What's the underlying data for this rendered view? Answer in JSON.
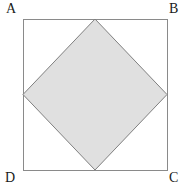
{
  "figure": {
    "background_color": "#ffffff",
    "width": 189,
    "height": 192,
    "outer_square": {
      "name": "ABCD",
      "stroke_color": "#8a8a8a",
      "fill_color": "none",
      "stroke_width": 1,
      "left": 23,
      "top": 19,
      "right": 167,
      "bottom": 170,
      "corners": [
        {
          "label": "A",
          "x": 23,
          "y": 19
        },
        {
          "label": "B",
          "x": 167,
          "y": 19
        },
        {
          "label": "C",
          "x": 167,
          "y": 170
        },
        {
          "label": "D",
          "x": 23,
          "y": 170
        }
      ]
    },
    "inscribed_square": {
      "name": "diamond",
      "stroke_color": "#808080",
      "fill_color": "#e0e0e0",
      "stroke_width": 1,
      "vertices": [
        {
          "position": "top",
          "x": 95,
          "y": 19
        },
        {
          "position": "right",
          "x": 167,
          "y": 94.5
        },
        {
          "position": "bottom",
          "x": 95,
          "y": 170
        },
        {
          "position": "left",
          "x": 23,
          "y": 94.5
        }
      ],
      "points_attr": "95,19 167,94.5 95,170 23,94.5"
    },
    "labels": {
      "A": "A",
      "B": "B",
      "C": "C",
      "D": "D"
    }
  }
}
